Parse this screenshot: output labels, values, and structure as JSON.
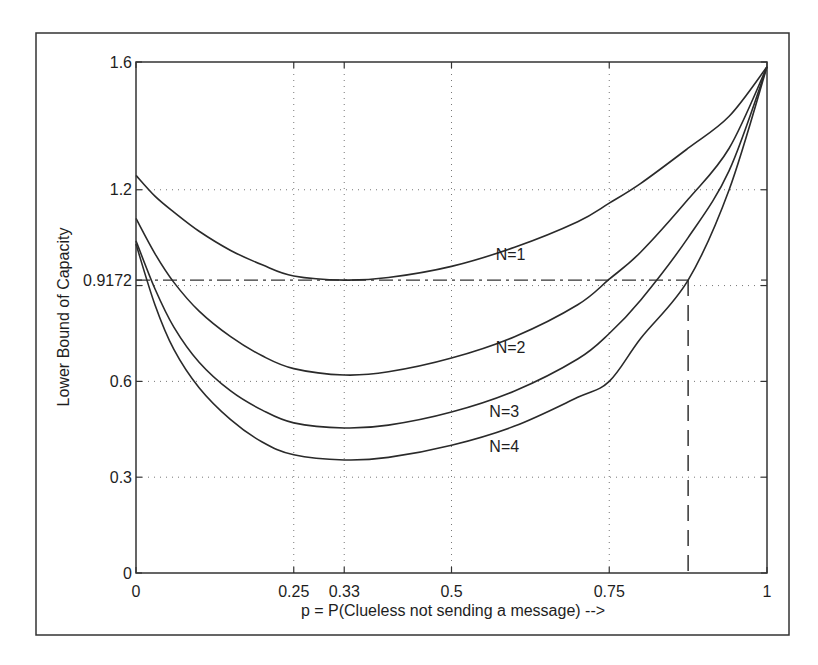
{
  "figure": {
    "frame_color": "#333333",
    "line_color": "#2a2a2a",
    "grid_color": "#777777"
  },
  "chart_data": {
    "type": "line",
    "title": "",
    "xlabel": "p = P(Clueless not sending a message) -->",
    "ylabel": "Lower Bound of Capacity",
    "xlim": [
      0,
      1
    ],
    "ylim": [
      0,
      1.6
    ],
    "xticks": [
      0,
      0.25,
      0.33,
      0.5,
      0.75,
      1
    ],
    "xtick_labels": [
      "0",
      "0.25",
      "0.33",
      "0.5",
      "0.75",
      "1"
    ],
    "yticks": [
      0,
      0.3,
      0.6,
      0.9172,
      1.2,
      1.6
    ],
    "ytick_labels": [
      "0",
      "0.3",
      "0.6",
      "0.9172",
      "1.2",
      "1.6"
    ],
    "grid": {
      "style": "dotted",
      "x": [
        0.25,
        0.33,
        0.5,
        0.75
      ],
      "y": [
        0.3,
        0.6,
        0.9,
        1.2
      ]
    },
    "legend": "inline labels",
    "x": [
      0,
      0.03,
      0.06,
      0.1,
      0.15,
      0.2,
      0.25,
      0.33,
      0.4,
      0.5,
      0.6,
      0.7,
      0.75,
      0.8,
      0.875,
      0.94,
      1.0
    ],
    "series": [
      {
        "name": "N=1",
        "label_pos": [
          0.57,
          0.98
        ],
        "values": [
          1.245,
          1.18,
          1.13,
          1.07,
          1.01,
          0.965,
          0.93,
          0.917,
          0.925,
          0.96,
          1.02,
          1.1,
          1.158,
          1.22,
          1.33,
          1.43,
          1.585
        ]
      },
      {
        "name": "N=2",
        "label_pos": [
          0.57,
          0.69
        ],
        "values": [
          1.11,
          1.0,
          0.91,
          0.82,
          0.74,
          0.68,
          0.64,
          0.62,
          0.63,
          0.673,
          0.74,
          0.84,
          0.92,
          1.005,
          1.17,
          1.33,
          1.585
        ]
      },
      {
        "name": "N=3",
        "label_pos": [
          0.56,
          0.49
        ],
        "values": [
          1.04,
          0.89,
          0.77,
          0.66,
          0.57,
          0.51,
          0.47,
          0.454,
          0.463,
          0.504,
          0.57,
          0.67,
          0.75,
          0.855,
          1.05,
          1.26,
          1.585
        ]
      },
      {
        "name": "N=4",
        "label_pos": [
          0.56,
          0.38
        ],
        "values": [
          1.03,
          0.84,
          0.7,
          0.58,
          0.48,
          0.41,
          0.37,
          0.354,
          0.362,
          0.4,
          0.46,
          0.55,
          0.6,
          0.735,
          0.917,
          1.2,
          1.585
        ]
      }
    ],
    "annotations": [
      {
        "type": "dash-dot-hline",
        "y": 0.9172,
        "x_from": 0,
        "x_to": 0.875,
        "note": "minimum of N=1 curve"
      },
      {
        "type": "dashed-vline",
        "x": 0.875,
        "y_from": 0,
        "y_to": 0.9172,
        "note": "where N=4 reaches 0.9172"
      }
    ]
  }
}
